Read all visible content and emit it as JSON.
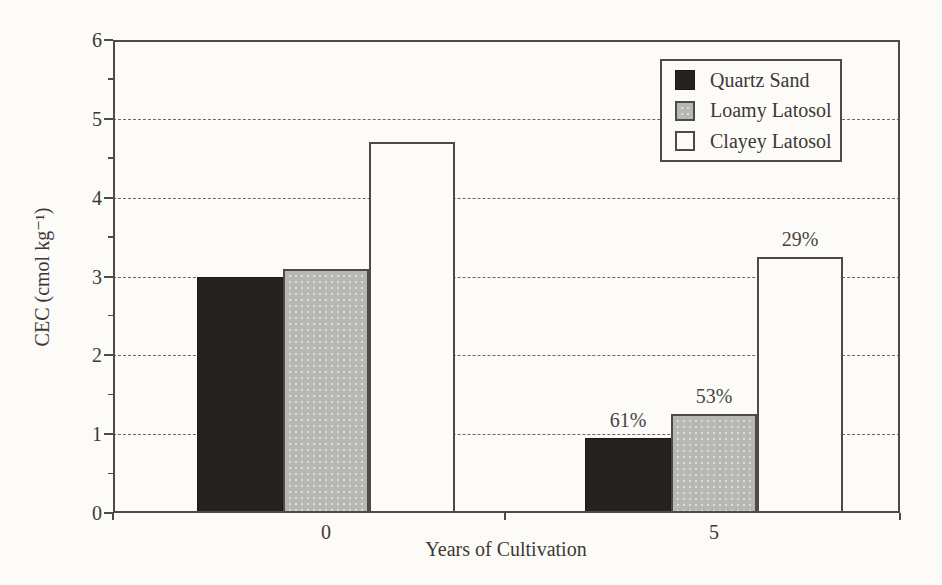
{
  "colors": {
    "paper": "#fcfbf8",
    "ink": "#3b3836",
    "line": "#4e4a47",
    "grid": "#6e6963",
    "bar_black": "#262222",
    "bar_gray": "#b7b7b5",
    "bar_white": "#fdfcfa"
  },
  "chart_data": {
    "type": "bar",
    "title": "",
    "xlabel": "Years of Cultivation",
    "ylabel": "CEC (cmol kg⁻¹)",
    "ylim": [
      0,
      6
    ],
    "yticks": [
      0,
      1,
      2,
      3,
      4,
      5,
      6
    ],
    "grid": "horizontal-dashed",
    "legend_position": "top-right",
    "categories": [
      "0",
      "5"
    ],
    "series": [
      {
        "name": "Quartz Sand",
        "fill": "black",
        "values": [
          3.0,
          0.95
        ],
        "labels": [
          "",
          "61%"
        ]
      },
      {
        "name": "Loamy Latosol",
        "fill": "stipple",
        "values": [
          3.1,
          1.25
        ],
        "labels": [
          "",
          "53%"
        ]
      },
      {
        "name": "Clayey Latosol",
        "fill": "white",
        "values": [
          4.7,
          3.25
        ],
        "labels": [
          "",
          "29%"
        ]
      }
    ]
  }
}
